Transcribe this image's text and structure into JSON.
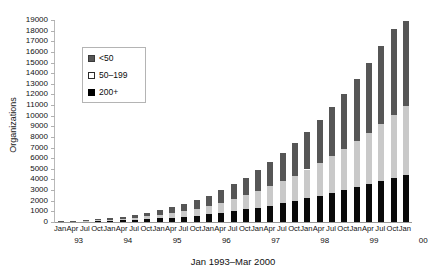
{
  "chart_data": {
    "type": "bar",
    "stacked": true,
    "title": "",
    "xlabel": "Jan 1993–Mar 2000",
    "ylabel": "Organizations",
    "ylim": [
      0,
      19000
    ],
    "ytick_step": 1000,
    "ytick_labels": [
      "19000",
      "18000",
      "17000",
      "16000",
      "15000",
      "14000",
      "13000",
      "12000",
      "11000",
      "10000",
      "9000",
      "8000",
      "7000",
      "6000",
      "5000",
      "4000",
      "3000",
      "2000",
      "1000",
      "0"
    ],
    "grid": false,
    "legend_position": "upper-left-inside",
    "legend": [
      {
        "label": "<50",
        "color": "#565656"
      },
      {
        "label": "50–199",
        "color": "#ffffff"
      },
      {
        "label": "200+",
        "color": "#000000"
      }
    ],
    "x_month_ticks": [
      "Jan",
      "Apr",
      "Jul",
      "Oct",
      "Jan",
      "Apr",
      "Jul",
      "Oct",
      "Jan",
      "Apr",
      "Jul",
      "Oct",
      "Jan",
      "Apr",
      "Jul",
      "Oct",
      "Jan",
      "Apr",
      "Jul",
      "Oct",
      "Jan",
      "Apr",
      "Jul",
      "Oct",
      "Jan",
      "Apr",
      "Jul",
      "Oct",
      "Jan"
    ],
    "x_year_ticks": [
      "93",
      "94",
      "95",
      "96",
      "97",
      "98",
      "99",
      "00"
    ],
    "categories": [
      "Jan 93",
      "Apr 93",
      "Jul 93",
      "Oct 93",
      "Jan 94",
      "Apr 94",
      "Jul 94",
      "Oct 94",
      "Jan 95",
      "Apr 95",
      "Jul 95",
      "Oct 95",
      "Jan 96",
      "Apr 96",
      "Jul 96",
      "Oct 96",
      "Jan 97",
      "Apr 97",
      "Jul 97",
      "Oct 97",
      "Jan 98",
      "Apr 98",
      "Jul 98",
      "Oct 98",
      "Jan 99",
      "Apr 99",
      "Jul 99",
      "Oct 99",
      "Jan 00"
    ],
    "series": [
      {
        "name": "200+",
        "color": "#0a0a0a",
        "values": [
          30,
          45,
          65,
          90,
          120,
          160,
          210,
          270,
          340,
          420,
          510,
          610,
          730,
          870,
          1020,
          1180,
          1360,
          1550,
          1760,
          1980,
          2220,
          2470,
          2740,
          3010,
          3300,
          3580,
          3870,
          4150,
          4450
        ]
      },
      {
        "name": "50–199",
        "color": "#c9c9c9",
        "values": [
          25,
          40,
          60,
          85,
          115,
          155,
          205,
          265,
          340,
          430,
          530,
          650,
          790,
          950,
          1130,
          1330,
          1560,
          1810,
          2090,
          2390,
          2720,
          3080,
          3470,
          3890,
          4340,
          4820,
          5330,
          5870,
          6450
        ]
      },
      {
        "name": "<50",
        "color": "#565656",
        "values": [
          30,
          50,
          75,
          105,
          145,
          195,
          255,
          330,
          420,
          530,
          655,
          800,
          970,
          1170,
          1400,
          1660,
          1960,
          2290,
          2660,
          3070,
          3530,
          4030,
          4580,
          5180,
          5840,
          6550,
          7320,
          8140,
          8000
        ]
      }
    ],
    "totals": [
      85,
      135,
      200,
      280,
      380,
      510,
      670,
      865,
      1100,
      1380,
      1695,
      2060,
      2490,
      2990,
      3550,
      4170,
      4880,
      5650,
      6510,
      7440,
      8470,
      9580,
      10790,
      12080,
      13480,
      14950,
      16520,
      18160,
      18900
    ]
  }
}
